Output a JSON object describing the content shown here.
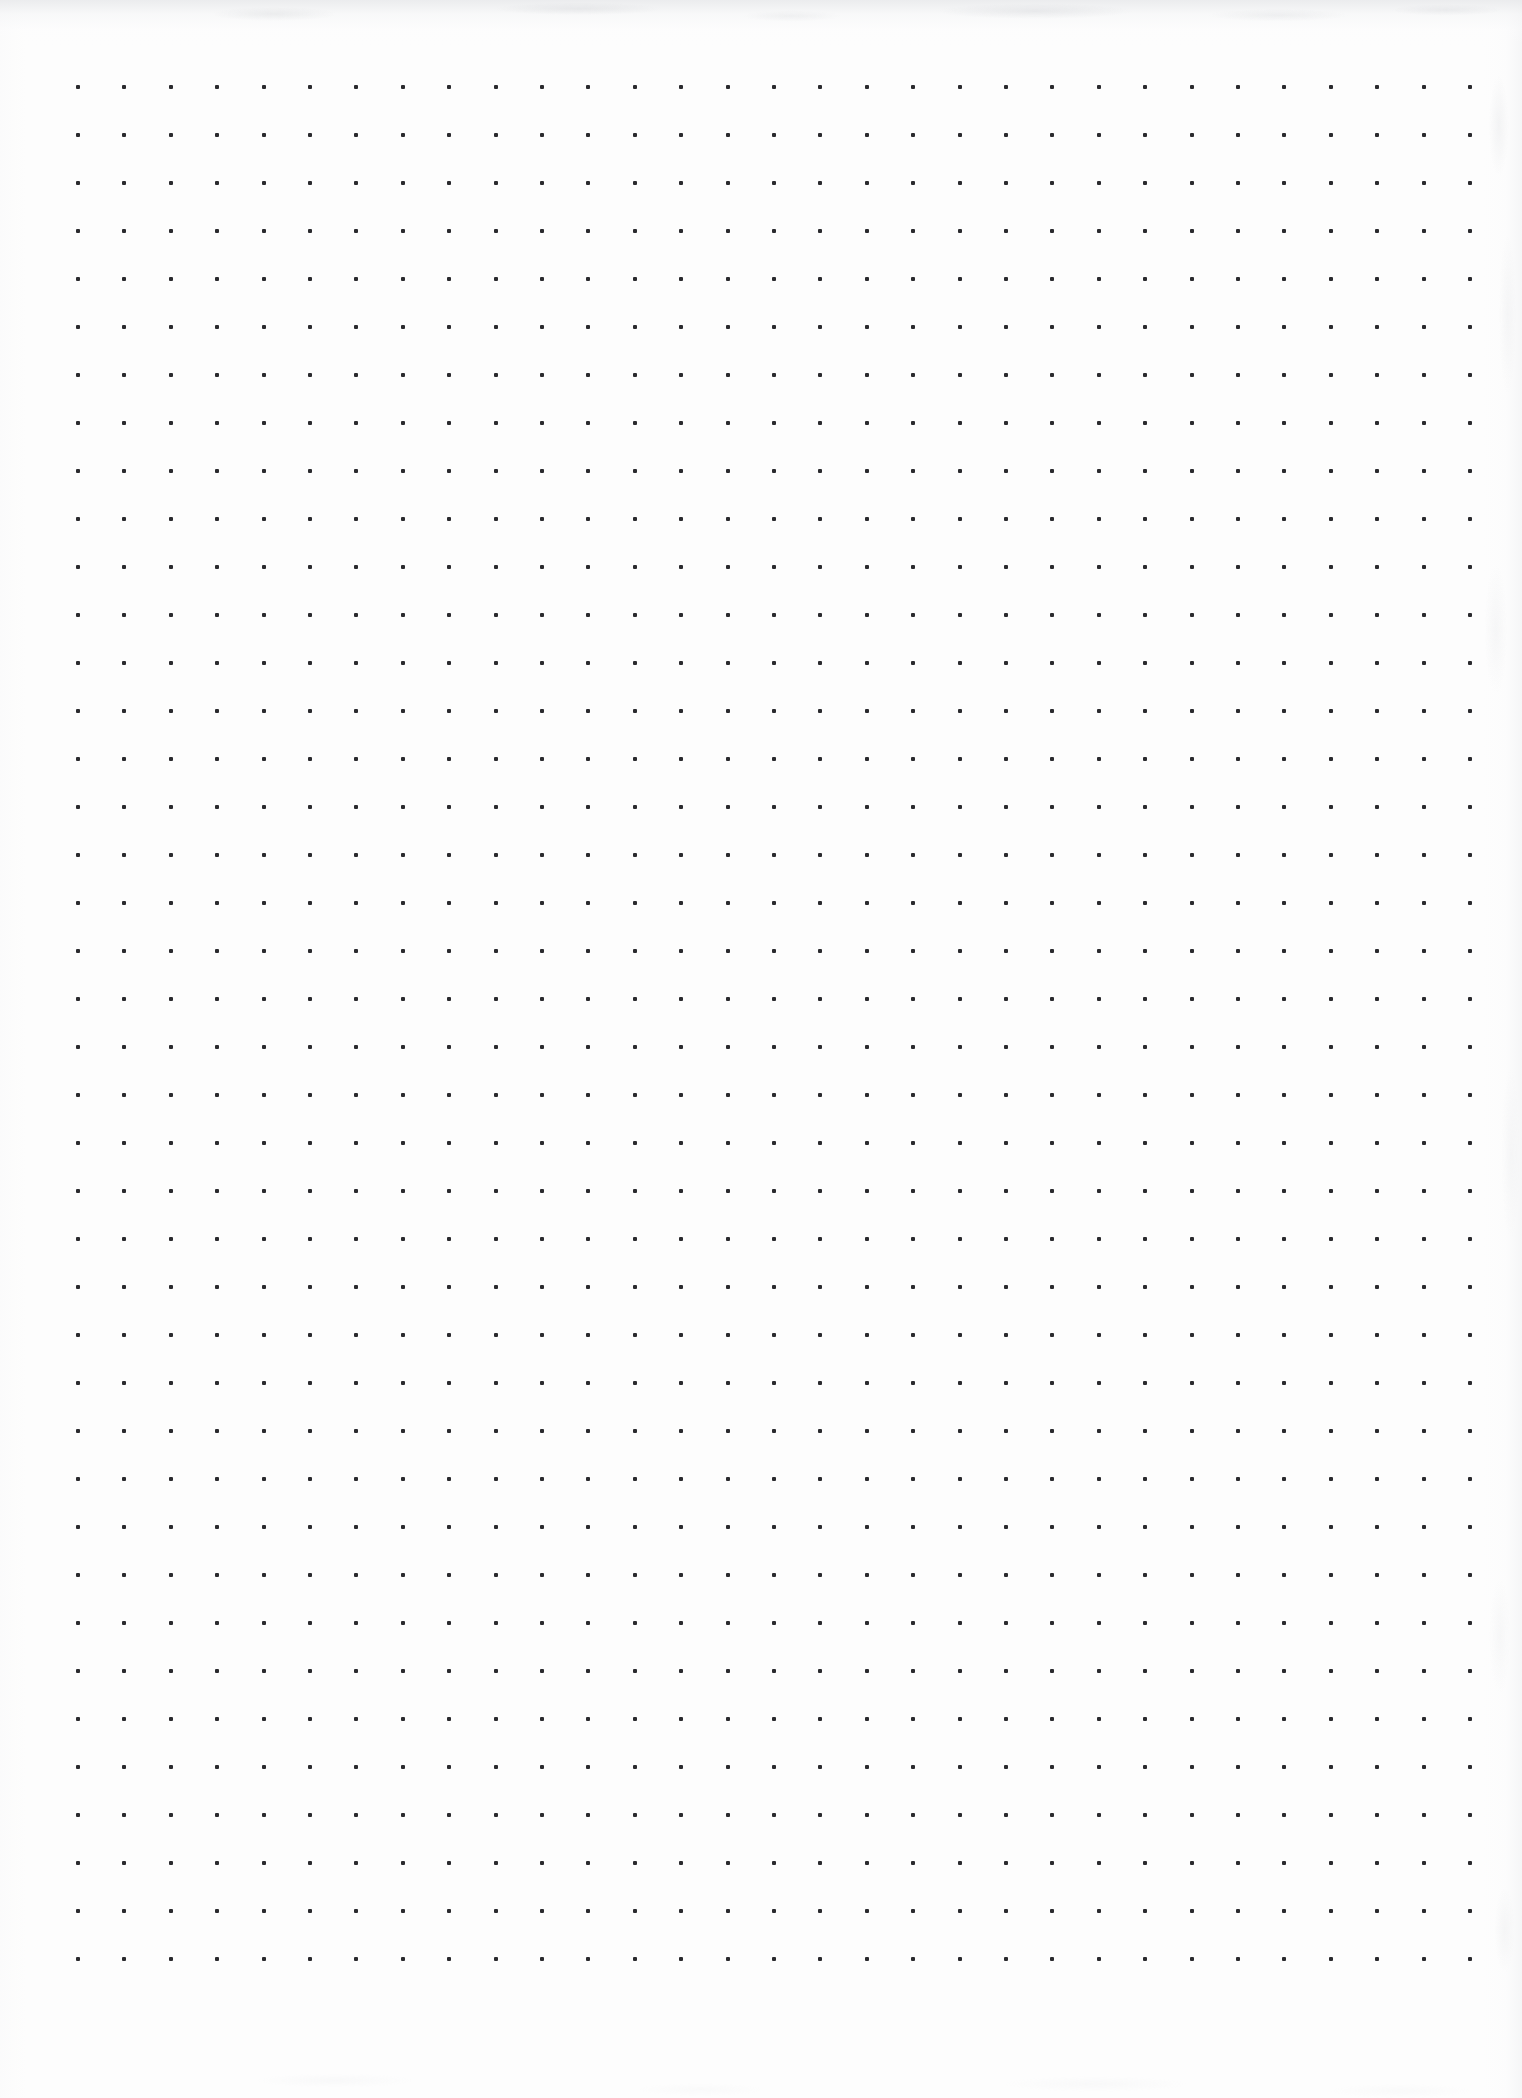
{
  "page": {
    "kind": "dot-grid-notebook-page",
    "width": 1522,
    "height": 2098,
    "paper_color": "#fdfdfd",
    "background_color": "#ffffff",
    "content_text": "",
    "has_handwriting": false,
    "has_printed_text": false
  },
  "grid": {
    "dot_color": "#2a2a2e",
    "dot_size_px": 4,
    "columns": 31,
    "rows": 40,
    "origin_x": 78,
    "origin_y": 87,
    "spacing_x": 46.4,
    "spacing_y": 48.0,
    "last_dot_x": 1470,
    "last_dot_y": 1959
  },
  "margins": {
    "left_px": 78,
    "right_px": 52,
    "top_px": 87,
    "bottom_px": 139
  },
  "scan_artifacts": {
    "top_shadow_color": "#e8e9eb",
    "top_shadow_height_px": 40,
    "right_edge_noise_color": "#d4d6da",
    "bottom_edge_noise_color": "#d8dadd"
  }
}
